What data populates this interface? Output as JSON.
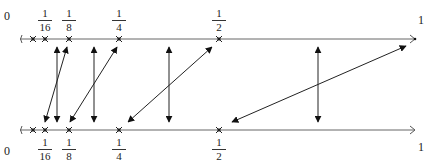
{
  "diagram": {
    "top_line": {
      "start_label": "0",
      "end_label": "1",
      "ticks": [
        {
          "num": "1",
          "den": "16",
          "x": 45
        },
        {
          "num": "1",
          "den": "8",
          "x": 69
        },
        {
          "num": "1",
          "den": "4",
          "x": 119
        },
        {
          "num": "1",
          "den": "2",
          "x": 219
        }
      ]
    },
    "bottom_line": {
      "start_label": "0",
      "end_label": "1",
      "ticks": [
        {
          "num": "1",
          "den": "16",
          "x": 45
        },
        {
          "num": "1",
          "den": "8",
          "x": 69
        },
        {
          "num": "1",
          "den": "4",
          "x": 119
        },
        {
          "num": "1",
          "den": "2",
          "x": 219
        }
      ]
    },
    "colors": {
      "line": "#555555",
      "arrow": "#111111"
    }
  }
}
